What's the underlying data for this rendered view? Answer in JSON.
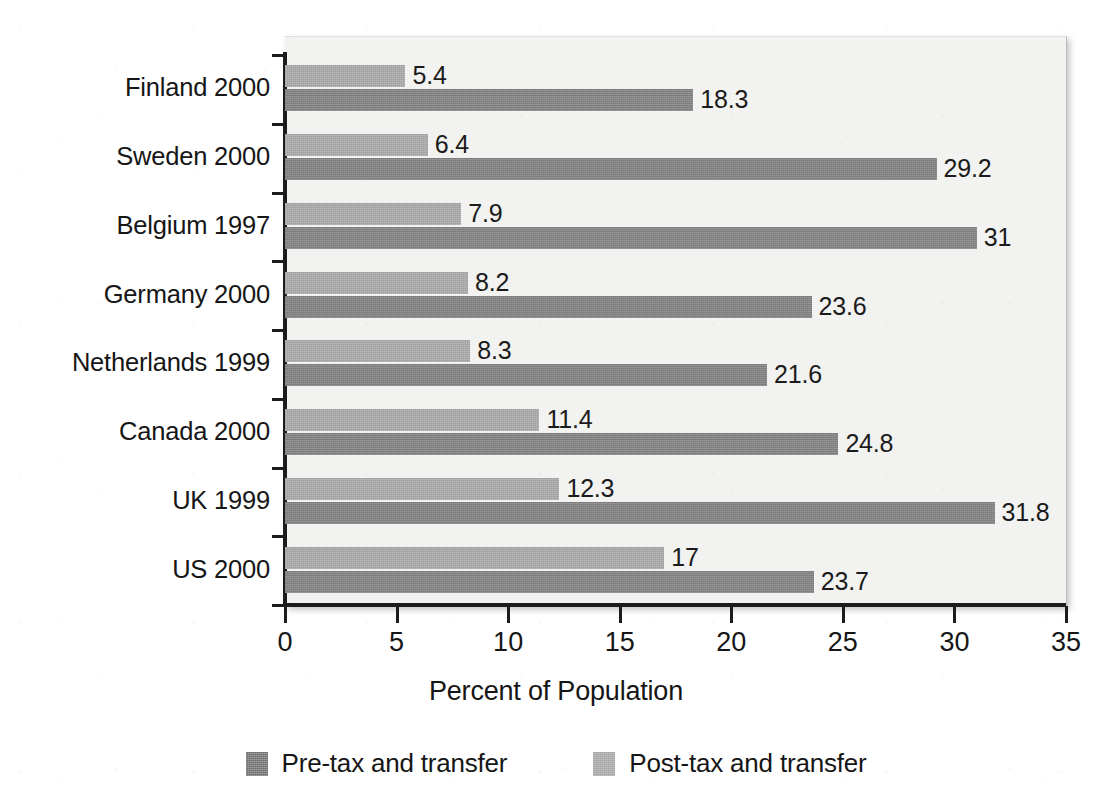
{
  "chart_data": {
    "type": "bar",
    "orientation": "horizontal",
    "title": "",
    "xlabel": "Percent of Population",
    "ylabel": "",
    "xlim": [
      0,
      35
    ],
    "xticks": [
      0,
      5,
      10,
      15,
      20,
      25,
      30,
      35
    ],
    "xtick_labels": [
      "0",
      "5",
      "10",
      "15",
      "20",
      "25",
      "30",
      "35"
    ],
    "grid": false,
    "legend_position": "bottom",
    "categories": [
      "Finland 2000",
      "Sweden 2000",
      "Belgium 1997",
      "Germany 2000",
      "Netherlands 1999",
      "Canada 2000",
      "UK 1999",
      "US 2000"
    ],
    "series": [
      {
        "name": "Pre-tax and transfer",
        "color": "#828282",
        "values": [
          18.3,
          29.2,
          31,
          23.6,
          21.6,
          24.8,
          31.8,
          23.7
        ],
        "value_labels": [
          "18.3",
          "29.2",
          "31",
          "23.6",
          "21.6",
          "24.8",
          "31.8",
          "23.7"
        ]
      },
      {
        "name": "Post-tax and transfer",
        "color": "#aaaaaa",
        "values": [
          5.4,
          6.4,
          7.9,
          8.2,
          8.3,
          11.4,
          12.3,
          17
        ],
        "value_labels": [
          "5.4",
          "6.4",
          "7.9",
          "8.2",
          "8.3",
          "11.4",
          "12.3",
          "17"
        ]
      }
    ]
  },
  "legend": {
    "items": [
      {
        "label": "Pre-tax and transfer",
        "color": "#828282"
      },
      {
        "label": "Post-tax and transfer",
        "color": "#aaaaaa"
      }
    ]
  }
}
